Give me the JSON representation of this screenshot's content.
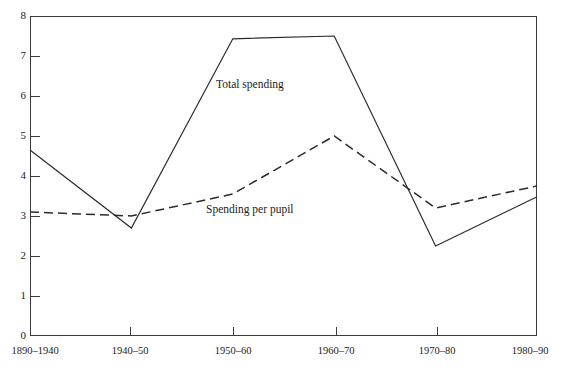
{
  "chart_data": {
    "type": "line",
    "title": "",
    "subtitle": "",
    "xlabel": "",
    "ylabel": "",
    "categories": [
      "1890–1940",
      "1940–50",
      "1950–60",
      "1960–70",
      "1970–80",
      "1980–90"
    ],
    "ylim": [
      0,
      8
    ],
    "yticks": [
      "0",
      "1",
      "2",
      "3",
      "4",
      "5",
      "6",
      "7",
      "8"
    ],
    "grid": false,
    "legend_position": "inline-annotations",
    "series": [
      {
        "name": "Total spending",
        "style": "solid",
        "color": "#2b2b2b",
        "values": [
          4.65,
          2.7,
          7.43,
          7.5,
          2.25,
          3.48
        ]
      },
      {
        "name": "Spending per pupil",
        "style": "dashed",
        "color": "#2b2b2b",
        "values": [
          3.1,
          3.0,
          3.55,
          5.0,
          3.2,
          3.75
        ]
      }
    ],
    "annotations": [
      {
        "text": "Total spending",
        "series": "Total spending"
      },
      {
        "text": "Spending per pupil",
        "series": "Spending per pupil"
      }
    ]
  },
  "axis": {
    "y_labels": [
      "8",
      "7",
      "6",
      "5",
      "4",
      "3",
      "2",
      "1",
      "0"
    ],
    "x_labels": [
      "1890–1940",
      "1940–50",
      "1950–60",
      "1960–70",
      "1970–80",
      "1980–90"
    ]
  },
  "labels": {
    "total_spending": "Total spending",
    "spending_per_pupil": "Spending per pupil"
  },
  "colors": {
    "line": "#2b2b2b",
    "axis": "#3a3a3a",
    "text": "#1a1a1a",
    "background": "#ffffff"
  }
}
